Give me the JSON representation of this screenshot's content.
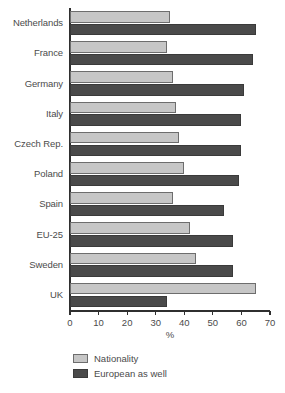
{
  "chart_data": {
    "type": "bar",
    "orientation": "horizontal",
    "title": "",
    "xlabel": "%",
    "ylabel": "",
    "xlim": [
      0,
      70
    ],
    "xticks": [
      0,
      10,
      20,
      30,
      40,
      50,
      60,
      70
    ],
    "xtick_labels": [
      "0",
      "10",
      "20",
      "30",
      "40",
      "50",
      "60",
      "70"
    ],
    "grid": false,
    "legend_position": "bottom-left",
    "categories": [
      "Netherlands",
      "France",
      "Germany",
      "Italy",
      "Czech Rep.",
      "Poland",
      "Spain",
      "EU-25",
      "Sweden",
      "UK"
    ],
    "series": [
      {
        "name": "Nationality",
        "color": "#c6c6c6",
        "values": [
          35,
          34,
          36,
          37,
          38,
          40,
          36,
          42,
          44,
          65
        ]
      },
      {
        "name": "European as well",
        "color": "#4a4a4a",
        "values": [
          65,
          64,
          61,
          60,
          60,
          59,
          54,
          57,
          57,
          34
        ]
      }
    ]
  },
  "axis": {
    "x_title": "%"
  },
  "legend": {
    "items": [
      {
        "label": "Nationality",
        "swatch": "light"
      },
      {
        "label": "European as well",
        "swatch": "dark"
      }
    ]
  }
}
